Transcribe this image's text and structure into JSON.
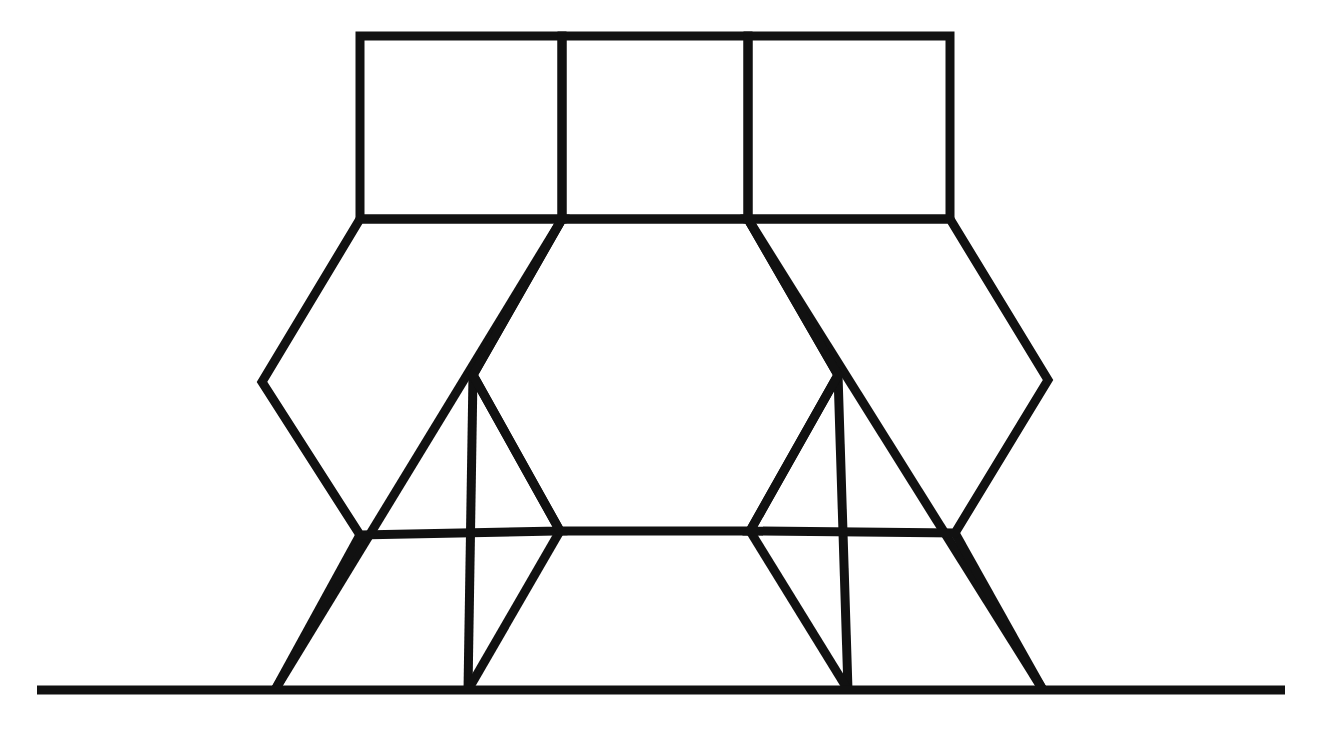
{
  "figure": {
    "background_color": "#ffffff",
    "stroke_color": "#111111",
    "canvas": {
      "width": 1327,
      "height": 736
    },
    "stroke_widths": {
      "thick": 9,
      "medium": 8,
      "baseline": 9
    },
    "vertices": {
      "sq_top_left": [
        360,
        36
      ],
      "sq_top_div1": [
        562,
        36
      ],
      "sq_top_div2": [
        748,
        36
      ],
      "sq_top_right": [
        950,
        36
      ],
      "sq_bot_left": [
        360,
        219
      ],
      "sq_bot_div1": [
        562,
        219
      ],
      "sq_bot_div2": [
        748,
        219
      ],
      "sq_bot_right": [
        950,
        219
      ],
      "left_outer_apex": [
        262,
        382
      ],
      "left_lower_node": [
        360,
        535
      ],
      "right_outer_apex": [
        1048,
        380
      ],
      "right_lower_node": [
        955,
        533
      ],
      "hex_left_apex": [
        473,
        375
      ],
      "hex_right_apex": [
        838,
        375
      ],
      "hex_bot_left": [
        560,
        531
      ],
      "hex_bot_right": [
        750,
        531
      ],
      "ground_left_end": [
        37,
        690
      ],
      "ground_right_end": [
        1285,
        690
      ],
      "ground_node_a": [
        275,
        690
      ],
      "ground_node_b": [
        468,
        690
      ],
      "ground_node_c": [
        848,
        690
      ],
      "ground_node_d": [
        1043,
        690
      ]
    },
    "elements": [
      {
        "name": "square-left",
        "label": "Top left square"
      },
      {
        "name": "square-middle",
        "label": "Top middle square"
      },
      {
        "name": "square-right",
        "label": "Top right square"
      },
      {
        "name": "hexagon-left",
        "label": "Left hexagonal face"
      },
      {
        "name": "hexagon-center",
        "label": "Center hexagon"
      },
      {
        "name": "hexagon-right",
        "label": "Right hexagonal face"
      },
      {
        "name": "ground-line",
        "label": "Horizontal ground line"
      }
    ]
  },
  "chart_data": {
    "type": "diagram",
    "shapes": [
      {
        "id": "square-left",
        "kind": "square",
        "points": [
          [
            360,
            36
          ],
          [
            562,
            36
          ],
          [
            562,
            219
          ],
          [
            360,
            219
          ]
        ]
      },
      {
        "id": "square-middle",
        "kind": "square",
        "points": [
          [
            562,
            36
          ],
          [
            748,
            36
          ],
          [
            748,
            219
          ],
          [
            562,
            219
          ]
        ]
      },
      {
        "id": "square-right",
        "kind": "square",
        "points": [
          [
            748,
            36
          ],
          [
            950,
            36
          ],
          [
            950,
            219
          ],
          [
            748,
            219
          ]
        ]
      },
      {
        "id": "hexagon-left",
        "kind": "hexagon",
        "points": [
          [
            360,
            219
          ],
          [
            562,
            219
          ],
          [
            473,
            375
          ],
          [
            560,
            531
          ],
          [
            360,
            535
          ],
          [
            262,
            382
          ]
        ]
      },
      {
        "id": "hexagon-center",
        "kind": "hexagon",
        "points": [
          [
            562,
            219
          ],
          [
            748,
            219
          ],
          [
            838,
            375
          ],
          [
            750,
            531
          ],
          [
            560,
            531
          ],
          [
            473,
            375
          ]
        ]
      },
      {
        "id": "hexagon-right",
        "kind": "hexagon",
        "points": [
          [
            748,
            219
          ],
          [
            950,
            219
          ],
          [
            1048,
            380
          ],
          [
            955,
            533
          ],
          [
            750,
            531
          ],
          [
            838,
            375
          ]
        ]
      }
    ],
    "legs": [
      {
        "id": "leg-outer-left",
        "from": [
          562,
          219
        ],
        "to": [
          275,
          690
        ]
      },
      {
        "id": "leg-inner-left",
        "from": [
          473,
          375
        ],
        "to": [
          468,
          690
        ]
      },
      {
        "id": "leg-inner-right",
        "from": [
          838,
          375
        ],
        "to": [
          848,
          690
        ]
      },
      {
        "id": "leg-outer-right",
        "from": [
          748,
          219
        ],
        "to": [
          1043,
          690
        ]
      },
      {
        "id": "leg-left-node",
        "from": [
          360,
          535
        ],
        "to": [
          275,
          690
        ]
      },
      {
        "id": "leg-right-node",
        "from": [
          955,
          533
        ],
        "to": [
          1043,
          690
        ]
      },
      {
        "id": "leg-hex-bot-left",
        "from": [
          560,
          531
        ],
        "to": [
          468,
          690
        ]
      },
      {
        "id": "leg-hex-bot-right",
        "from": [
          750,
          531
        ],
        "to": [
          848,
          690
        ]
      }
    ],
    "ground_line": {
      "from": [
        37,
        690
      ],
      "to": [
        1285,
        690
      ]
    }
  }
}
